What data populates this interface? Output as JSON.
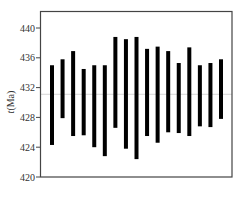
{
  "chart_data": {
    "type": "bar",
    "subtype": "floating-range",
    "title": "",
    "xlabel": "",
    "ylabel": "t(Ma)",
    "ylim": [
      420,
      442.3
    ],
    "yticks": [
      420,
      424,
      428,
      432,
      436,
      440
    ],
    "grid": false,
    "legend": null,
    "reference_line": 431.1,
    "categories": [
      "1",
      "2",
      "3",
      "4",
      "5",
      "6",
      "7",
      "8",
      "9",
      "10",
      "11",
      "12",
      "13",
      "14",
      "15",
      "16",
      "17"
    ],
    "series": [
      {
        "name": "upper",
        "values": [
          435.0,
          435.8,
          436.9,
          434.5,
          435.0,
          435.0,
          438.8,
          438.5,
          438.8,
          437.2,
          437.5,
          436.9,
          435.3,
          437.4,
          435.0,
          435.3,
          435.8
        ]
      },
      {
        "name": "lower",
        "values": [
          424.3,
          427.9,
          425.5,
          425.6,
          424.0,
          422.8,
          426.6,
          423.8,
          422.4,
          425.5,
          424.6,
          426.0,
          425.9,
          425.5,
          426.8,
          426.7,
          427.8
        ]
      }
    ],
    "colors": {
      "bar": "#000000",
      "axis": "#444444",
      "reference_line": "#cccccc"
    }
  }
}
